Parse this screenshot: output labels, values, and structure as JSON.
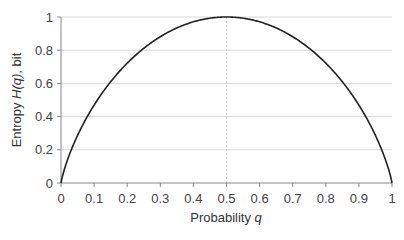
{
  "chart_data": {
    "type": "line",
    "title": "",
    "xlabel": "Probability q",
    "xlabel_parts": {
      "text": "Probability ",
      "italic": "q"
    },
    "ylabel": "Entropy H(q), bit",
    "ylabel_parts": {
      "pre": "Entropy ",
      "italic": "H(q)",
      "post": ", bit"
    },
    "xlim": [
      0,
      1
    ],
    "ylim": [
      0,
      1
    ],
    "x_ticks": [
      "0",
      "0.1",
      "0.2",
      "0.3",
      "0.4",
      "0.5",
      "0.6",
      "0.7",
      "0.8",
      "0.9",
      "1"
    ],
    "y_ticks": [
      "0",
      "0.2",
      "0.4",
      "0.6",
      "0.8",
      "1"
    ],
    "grid": {
      "horizontal": true,
      "vertical": false
    },
    "annotations": [
      {
        "type": "vertical-dashed-line",
        "x": 0.5
      }
    ],
    "series": [
      {
        "name": "H(q) = -q log2 q - (1-q) log2 (1-q)",
        "x": [
          0,
          0.05,
          0.1,
          0.15,
          0.2,
          0.25,
          0.3,
          0.35,
          0.4,
          0.45,
          0.5,
          0.55,
          0.6,
          0.65,
          0.7,
          0.75,
          0.8,
          0.85,
          0.9,
          0.95,
          1
        ],
        "values": [
          0,
          0.286,
          0.469,
          0.61,
          0.722,
          0.811,
          0.881,
          0.934,
          0.971,
          0.993,
          1.0,
          0.993,
          0.971,
          0.934,
          0.881,
          0.811,
          0.722,
          0.61,
          0.469,
          0.286,
          0
        ],
        "color": "#222222"
      }
    ],
    "legend": null
  },
  "colors": {
    "curve": "#222222",
    "grid": "#d9d9d9",
    "axis": "#888888",
    "dashed": "#cccccc"
  }
}
